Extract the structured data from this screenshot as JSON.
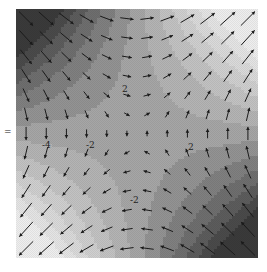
{
  "chart_data": {
    "type": "heatmap",
    "subtype": "filled-contour-with-quiver",
    "title": "",
    "xlabel": "",
    "ylabel": "",
    "axes_visible": false,
    "grid": false,
    "colormap": "grayscale",
    "plot_area": {
      "x0": 16,
      "y0": 9,
      "x1": 258,
      "y1": 258
    },
    "domain": {
      "xlim": [
        -2,
        2
      ],
      "ylim": [
        -2,
        2
      ]
    },
    "field": "z = 4*sin(pi*x/4)*sin(pi*y/4)... approx saddle: z = -x*y*1.5 - shaped so top-left & bottom-right dark (negative), top-right & bottom-left light (positive)",
    "levels": [
      -6,
      -5,
      -4,
      -3,
      -2,
      -1,
      0,
      1,
      2,
      3,
      4,
      5,
      6
    ],
    "level_colors": [
      "#3a3a3a",
      "#4a4a4a",
      "#5c5c5c",
      "#6e6e6e",
      "#808080",
      "#939393",
      "#a6a6a6",
      "#b4b4b4",
      "#c2c2c2",
      "#cfcfcf",
      "#dadada",
      "#e4e4e4",
      "#eeeeee"
    ],
    "contour_labels": [
      {
        "text": "-4",
        "x": 42,
        "y": 148
      },
      {
        "text": "-2",
        "x": 86,
        "y": 148
      },
      {
        "text": "2",
        "x": 188,
        "y": 150
      },
      {
        "text": "-2",
        "x": 130,
        "y": 203
      },
      {
        "text": "2",
        "x": 122,
        "y": 92
      }
    ],
    "quiver": {
      "grid_nx": 12,
      "grid_ny": 13,
      "arrow_color": "#1a1a1a",
      "note": "arrows follow gradient of field; long vertical arrows near top and bottom edges, short arrows near center"
    },
    "side_mark": {
      "text": "=",
      "x": 4,
      "y": 135
    }
  }
}
